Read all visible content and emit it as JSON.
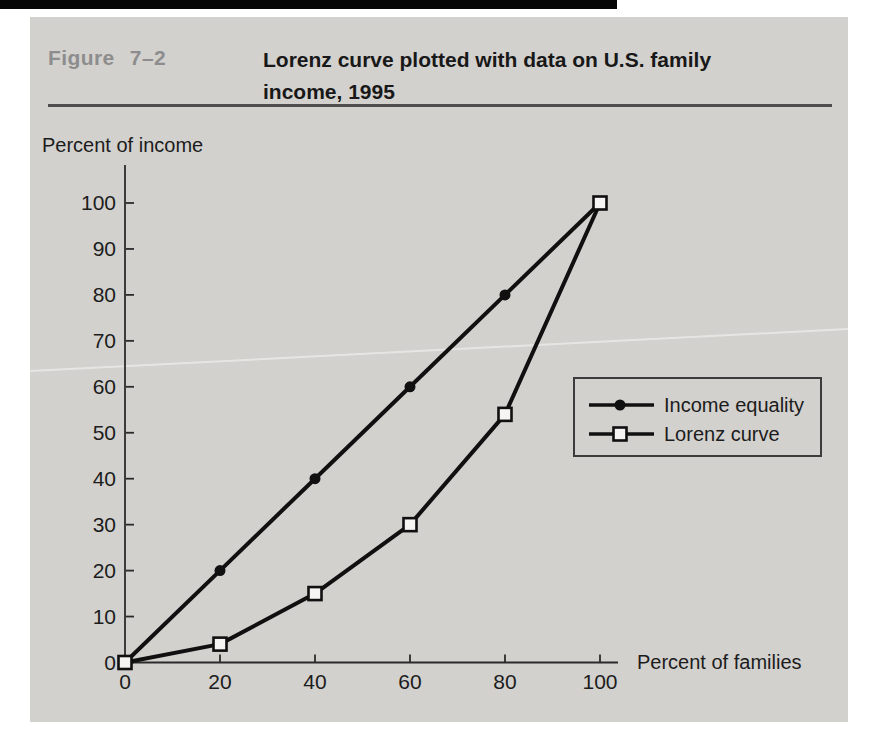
{
  "figure": {
    "label": "Figure 7–2",
    "title": "Lorenz curve plotted with data on U.S. family income, 1995",
    "title_lines": [
      "Lorenz curve plotted with data on U.S. family",
      "income, 1995"
    ]
  },
  "colors": {
    "panel_bg": "#d3d1ce",
    "series_line": "#101010",
    "figure_label": "#8d8d8d",
    "header_rule": "#4e4e4e"
  },
  "chart_data": {
    "type": "line",
    "title": "Lorenz curve plotted with data on U.S. family income, 1995",
    "xlabel": "Percent of families",
    "ylabel": "Percent of income",
    "x": [
      0,
      20,
      40,
      60,
      80,
      100
    ],
    "series": [
      {
        "name": "Income equality",
        "marker": "filled-circle",
        "values": [
          0,
          20,
          40,
          60,
          80,
          100
        ]
      },
      {
        "name": "Lorenz curve",
        "marker": "open-square",
        "values": [
          0,
          4,
          15,
          30,
          54,
          100
        ]
      }
    ],
    "x_ticks": [
      0,
      20,
      40,
      60,
      80,
      100
    ],
    "y_ticks": [
      0,
      10,
      20,
      30,
      40,
      50,
      60,
      70,
      80,
      90,
      100
    ],
    "xlim": [
      0,
      100
    ],
    "ylim": [
      0,
      100
    ],
    "grid": false,
    "legend_position": "right-middle"
  }
}
